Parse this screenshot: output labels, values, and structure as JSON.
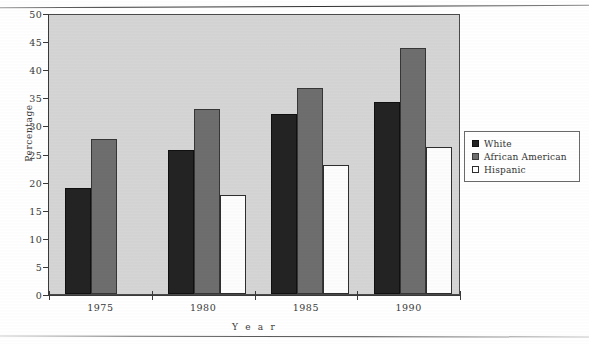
{
  "chart_data": {
    "type": "bar",
    "title": "",
    "subtitle": "",
    "xlabel": "Year",
    "ylabel": "Percentage",
    "categories": [
      "1975",
      "1980",
      "1985",
      "1990"
    ],
    "series": [
      {
        "name": "White",
        "color": "#232323",
        "values": [
          18.8,
          25.6,
          32.0,
          34.2
        ]
      },
      {
        "name": "African  American",
        "color": "#6e6e6e",
        "values": [
          27.6,
          33.0,
          36.7,
          43.7
        ]
      },
      {
        "name": "Hispanic",
        "color": "#ffffff",
        "values": [
          null,
          17.6,
          23.0,
          26.2
        ]
      }
    ],
    "ylim": [
      0,
      50
    ],
    "ytick_step": 5,
    "yticks": [
      "0",
      "5",
      "10",
      "15",
      "20",
      "25",
      "30",
      "35",
      "40",
      "45",
      "50"
    ],
    "grid": false,
    "legend_position": "right-outside",
    "plot_background": "#d5d5d5",
    "axis_color": "#3a3a3a"
  },
  "legend": {
    "entries": [
      {
        "label": "White"
      },
      {
        "label": "African   American"
      },
      {
        "label": "Hispanic"
      }
    ]
  },
  "axes": {
    "y_title": "Percentage",
    "x_title": "Y e a r"
  }
}
